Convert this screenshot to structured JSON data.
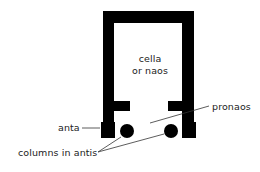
{
  "diagram": {
    "colors": {
      "wall": "#000000",
      "text": "#222222",
      "leader": "#333333",
      "background": "#ffffff"
    },
    "labels": {
      "cella_line1": "cella",
      "cella_line2": "or naos",
      "pronaos": "pronaos",
      "anta": "anta",
      "columns": "columns in antis"
    },
    "elements": [
      {
        "id": "cella",
        "label": "cella or naos",
        "kind": "room"
      },
      {
        "id": "pronaos",
        "label": "pronaos",
        "kind": "porch"
      },
      {
        "id": "anta-left",
        "label": "anta",
        "kind": "wall-end"
      },
      {
        "id": "anta-right",
        "kind": "wall-end"
      },
      {
        "id": "column-left",
        "label": "columns in antis",
        "kind": "column"
      },
      {
        "id": "column-right",
        "label": "columns in antis",
        "kind": "column"
      }
    ]
  }
}
